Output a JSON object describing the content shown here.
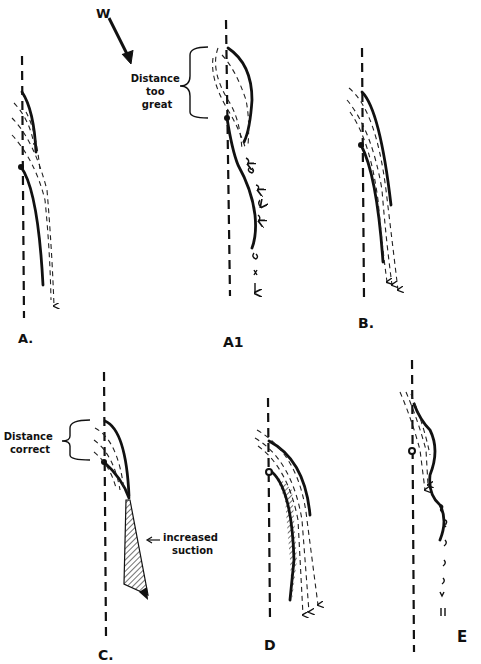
{
  "figure": {
    "wind_label": "W",
    "panels": [
      {
        "id": "A",
        "label": "A."
      },
      {
        "id": "A1",
        "label": "A1",
        "annotation": [
          "Distance",
          "too",
          "great"
        ]
      },
      {
        "id": "B",
        "label": "B."
      },
      {
        "id": "C",
        "label": "C.",
        "annotation": [
          "Distance",
          "correct"
        ],
        "note": [
          "increased",
          "suction"
        ]
      },
      {
        "id": "D",
        "label": "D"
      },
      {
        "id": "E",
        "label": "E"
      }
    ]
  }
}
